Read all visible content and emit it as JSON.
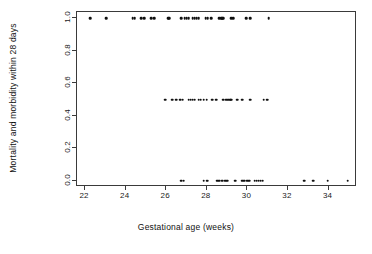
{
  "chart_data": {
    "type": "scatter",
    "title": "",
    "xlabel": "Gestational age (weeks)",
    "ylabel": "Mortality and morbidity within 28 days",
    "xlim": [
      21.6,
      35.4
    ],
    "ylim": [
      -0.04,
      1.04
    ],
    "xticks": [
      22,
      24,
      26,
      28,
      30,
      32,
      34
    ],
    "xticklabels": [
      "22",
      "24",
      "26",
      "28",
      "30",
      "32",
      "34"
    ],
    "yticks": [
      0.0,
      0.2,
      0.4,
      0.6,
      0.8,
      1.0
    ],
    "yticklabels": [
      "0.0",
      "0.2",
      "0.4",
      "0.6",
      "0.8",
      "1.0"
    ],
    "grid": false,
    "legend": null,
    "marker": "filled-circle",
    "marker_color": "#101010",
    "marker_size": 2.6,
    "frame_color": "#3a3a3a",
    "background": "#ffffff",
    "series": [
      {
        "name": "observations",
        "points": [
          [
            22.25,
            1.0
          ],
          [
            23.05,
            1.0
          ],
          [
            24.35,
            1.0
          ],
          [
            24.45,
            1.0
          ],
          [
            24.75,
            1.0
          ],
          [
            24.9,
            1.0
          ],
          [
            25.25,
            1.0
          ],
          [
            25.4,
            1.0
          ],
          [
            26.1,
            1.0
          ],
          [
            26.15,
            1.0
          ],
          [
            26.75,
            1.0
          ],
          [
            26.9,
            1.0
          ],
          [
            27.0,
            1.0
          ],
          [
            27.1,
            1.0
          ],
          [
            27.3,
            1.0
          ],
          [
            27.4,
            1.0
          ],
          [
            27.5,
            1.0
          ],
          [
            27.6,
            1.0
          ],
          [
            27.95,
            1.0
          ],
          [
            28.05,
            1.0
          ],
          [
            28.2,
            1.0
          ],
          [
            28.6,
            1.0
          ],
          [
            28.7,
            1.0
          ],
          [
            28.75,
            1.0
          ],
          [
            28.8,
            1.0
          ],
          [
            29.2,
            1.0
          ],
          [
            29.3,
            1.0
          ],
          [
            29.95,
            1.0
          ],
          [
            30.15,
            1.0
          ],
          [
            31.05,
            1.0
          ]
        ]
      },
      {
        "name": "observations-mid",
        "points": [
          [
            25.95,
            0.5
          ],
          [
            26.3,
            0.5
          ],
          [
            26.5,
            0.5
          ],
          [
            26.7,
            0.5
          ],
          [
            26.8,
            0.5
          ],
          [
            27.1,
            0.5
          ],
          [
            27.2,
            0.5
          ],
          [
            27.3,
            0.5
          ],
          [
            27.4,
            0.5
          ],
          [
            27.6,
            0.5
          ],
          [
            27.7,
            0.5
          ],
          [
            27.85,
            0.5
          ],
          [
            28.0,
            0.5
          ],
          [
            28.25,
            0.5
          ],
          [
            28.45,
            0.5
          ],
          [
            28.8,
            0.5
          ],
          [
            28.95,
            0.5
          ],
          [
            29.05,
            0.5
          ],
          [
            29.15,
            0.5
          ],
          [
            29.2,
            0.5
          ],
          [
            29.5,
            0.5
          ],
          [
            29.75,
            0.5
          ],
          [
            30.15,
            0.5
          ],
          [
            30.8,
            0.5
          ],
          [
            30.95,
            0.5
          ],
          [
            31.0,
            0.5
          ]
        ]
      },
      {
        "name": "observations-low",
        "points": [
          [
            26.75,
            0.0
          ],
          [
            26.85,
            0.0
          ],
          [
            27.85,
            0.0
          ],
          [
            28.0,
            0.0
          ],
          [
            28.05,
            0.0
          ],
          [
            28.5,
            0.0
          ],
          [
            28.6,
            0.0
          ],
          [
            28.75,
            0.0
          ],
          [
            28.9,
            0.0
          ],
          [
            29.0,
            0.0
          ],
          [
            29.4,
            0.0
          ],
          [
            29.75,
            0.0
          ],
          [
            29.85,
            0.0
          ],
          [
            30.0,
            0.0
          ],
          [
            30.1,
            0.0
          ],
          [
            30.35,
            0.0
          ],
          [
            30.45,
            0.0
          ],
          [
            30.55,
            0.0
          ],
          [
            30.65,
            0.0
          ],
          [
            30.75,
            0.0
          ],
          [
            32.8,
            0.0
          ],
          [
            33.25,
            0.0
          ],
          [
            33.95,
            0.0
          ],
          [
            34.95,
            0.0
          ]
        ]
      }
    ]
  }
}
